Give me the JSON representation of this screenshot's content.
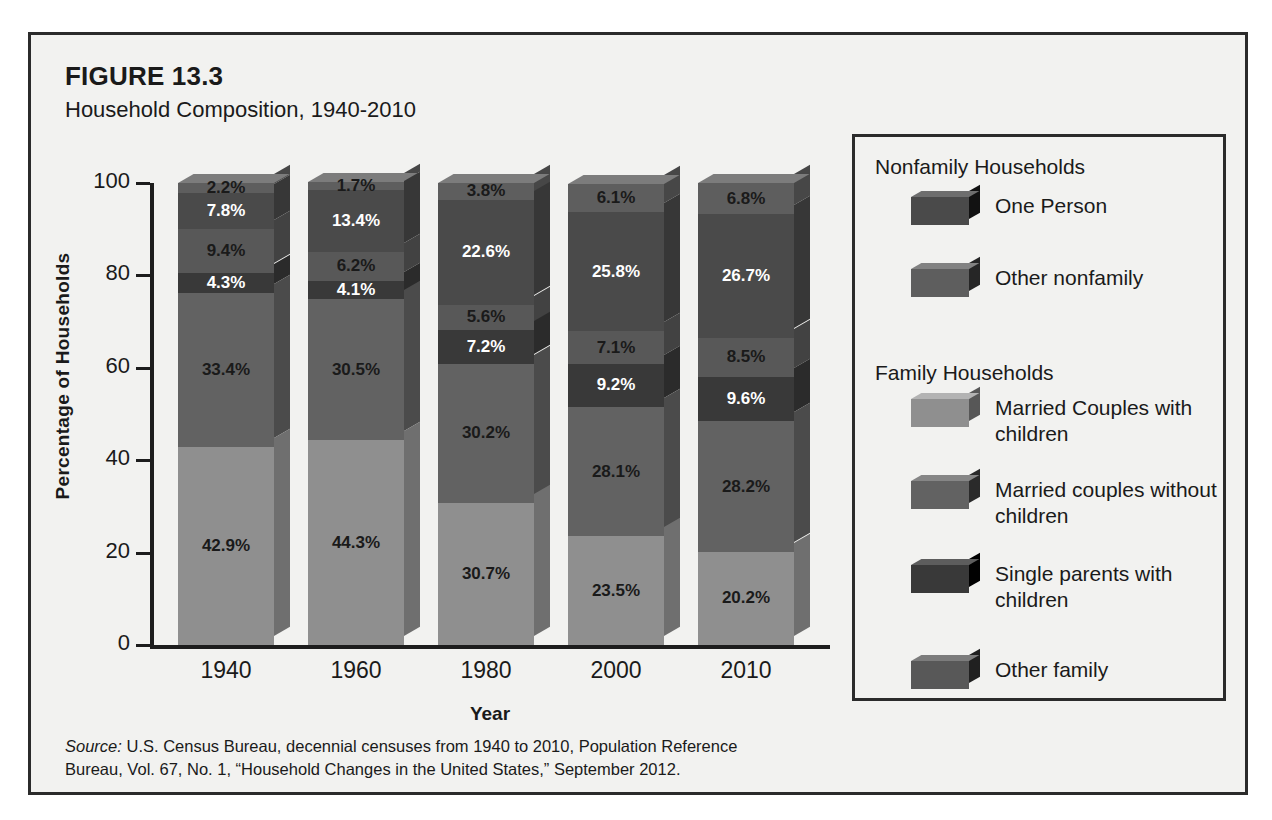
{
  "figure": {
    "number": "FIGURE 13.3",
    "title": "Household Composition, 1940-2010",
    "source_prefix": "Source:",
    "source_text": " U.S. Census Bureau, decennial censuses from 1940 to 2010, Population Reference Bureau, Vol. 67, No. 1, “Household Changes in the United States,” September 2012."
  },
  "legend": {
    "group1_heading": "Nonfamily Households",
    "group2_heading": "Family Households",
    "items": [
      {
        "label": "One Person",
        "color": "#4a4a4a",
        "group": "nonfamily"
      },
      {
        "label": "Other nonfamily",
        "color": "#5e5e5e",
        "group": "nonfamily"
      },
      {
        "label": "Married Couples with children",
        "color": "#8f8f8f",
        "group": "family"
      },
      {
        "label": "Married couples without children",
        "color": "#626262",
        "group": "family"
      },
      {
        "label": "Single parents with children",
        "color": "#393939",
        "group": "family"
      },
      {
        "label": "Other family",
        "color": "#585858",
        "group": "family"
      }
    ]
  },
  "chart_data": {
    "type": "bar",
    "stacked": true,
    "title": "Household Composition, 1940-2010",
    "xlabel": "Year",
    "ylabel": "Percentage of Households",
    "ylim": [
      0,
      100
    ],
    "yticks": [
      0,
      20,
      40,
      60,
      80,
      100
    ],
    "ytick_labels": [
      "0",
      "20",
      "40",
      "60",
      "80",
      "100"
    ],
    "grid": false,
    "legend_position": "right",
    "categories": [
      "1940",
      "1960",
      "1980",
      "2000",
      "2010"
    ],
    "series": [
      {
        "name": "Married Couples with children",
        "color": "#8f8f8f",
        "top_color": "#a3a3a3",
        "side_color": "#6f6f6f",
        "label_color": "dark",
        "values": [
          42.9,
          44.3,
          30.7,
          23.5,
          20.2
        ],
        "labels": [
          "42.9%",
          "44.3%",
          "30.7%",
          "23.5%",
          "20.2%"
        ]
      },
      {
        "name": "Married couples without children",
        "color": "#626262",
        "top_color": "#757575",
        "side_color": "#4b4b4b",
        "label_color": "dark",
        "values": [
          33.4,
          30.5,
          30.2,
          28.1,
          28.2
        ],
        "labels": [
          "33.4%",
          "30.5%",
          "30.2%",
          "28.1%",
          "28.2%"
        ]
      },
      {
        "name": "Single parents with children",
        "color": "#393939",
        "top_color": "#4a4a4a",
        "side_color": "#2b2b2b",
        "label_color": "light",
        "values": [
          4.3,
          4.1,
          7.2,
          9.2,
          9.6
        ],
        "labels": [
          "4.3%",
          "4.1%",
          "7.2%",
          "9.2%",
          "9.6%"
        ]
      },
      {
        "name": "Other family",
        "color": "#585858",
        "top_color": "#6b6b6b",
        "side_color": "#424242",
        "label_color": "dark",
        "values": [
          9.4,
          6.2,
          5.6,
          7.1,
          8.5
        ],
        "labels": [
          "9.4%",
          "6.2%",
          "5.6%",
          "7.1%",
          "8.5%"
        ]
      },
      {
        "name": "One Person",
        "color": "#4a4a4a",
        "top_color": "#5c5c5c",
        "side_color": "#373737",
        "label_color": "light",
        "values": [
          7.8,
          13.4,
          22.6,
          25.8,
          26.7
        ],
        "labels": [
          "7.8%",
          "13.4%",
          "22.6%",
          "25.8%",
          "26.7%"
        ]
      },
      {
        "name": "Other nonfamily",
        "color": "#5e5e5e",
        "top_color": "#7c7c7c",
        "side_color": "#474747",
        "label_color": "dark",
        "values": [
          2.2,
          1.7,
          3.8,
          6.1,
          6.8
        ],
        "labels": [
          "2.2%",
          "1.7%",
          "3.8%",
          "6.1%",
          "6.8%"
        ]
      }
    ]
  }
}
